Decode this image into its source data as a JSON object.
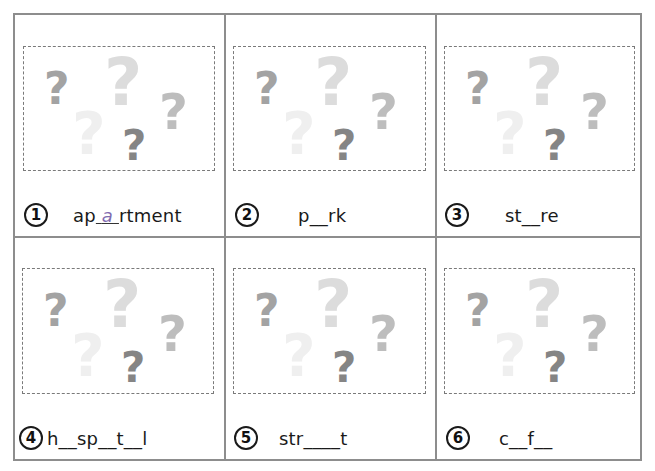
{
  "worksheet": {
    "items": [
      {
        "number": "1",
        "prefix": "ap",
        "answer": "a",
        "suffix": "rtment",
        "display": "ap_a_rtment"
      },
      {
        "number": "2",
        "word": "p__rk"
      },
      {
        "number": "3",
        "word": "st__re"
      },
      {
        "number": "4",
        "word": "h__sp__t__l"
      },
      {
        "number": "5",
        "word": "str____t"
      },
      {
        "number": "6",
        "word": "c__f__"
      }
    ],
    "picture_placeholder": {
      "icon": "question-mark-icon",
      "glyph": "?",
      "colors": [
        "#a3a3a3",
        "#d9d9d9",
        "#bdbdbd",
        "#ececec",
        "#858585"
      ]
    },
    "colors": {
      "grid_border": "#8d8d8d",
      "dashed_border": "#7a7a7a",
      "answer_text": "#7f6bb0"
    }
  }
}
